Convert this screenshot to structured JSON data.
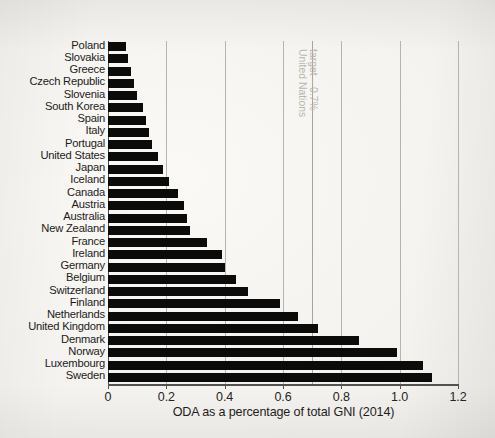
{
  "chart_data": {
    "type": "bar",
    "orientation": "horizontal",
    "title": "",
    "xlabel": "ODA as a percentage of total GNI (2014)",
    "ylabel": "",
    "xlim": [
      0,
      1.2
    ],
    "xticks": [
      "0",
      "0.2",
      "0.4",
      "0.6",
      "0.8",
      "1.0",
      "1.2"
    ],
    "xtick_values": [
      0,
      0.2,
      0.4,
      0.6,
      0.8,
      1.0,
      1.2
    ],
    "grid": "vertical",
    "legend": "none",
    "bar_color": "#0b0b0a",
    "grid_color": "#b7b4ae",
    "background_color": "#f3f1ed",
    "categories": [
      "Poland",
      "Slovakia",
      "Greece",
      "Czech Republic",
      "Slovenia",
      "South Korea",
      "Spain",
      "Italy",
      "Portugal",
      "United States",
      "Japan",
      "Iceland",
      "Canada",
      "Austria",
      "Australia",
      "New Zealand",
      "France",
      "Ireland",
      "Germany",
      "Belgium",
      "Switzerland",
      "Finland",
      "Netherlands",
      "United Kingdom",
      "Denmark",
      "Norway",
      "Luxembourg",
      "Sweden"
    ],
    "values": [
      0.06,
      0.07,
      0.08,
      0.09,
      0.1,
      0.12,
      0.13,
      0.14,
      0.15,
      0.17,
      0.19,
      0.21,
      0.24,
      0.26,
      0.27,
      0.28,
      0.34,
      0.39,
      0.4,
      0.44,
      0.48,
      0.59,
      0.65,
      0.72,
      0.86,
      0.99,
      1.08,
      1.11
    ],
    "annotations": [
      {
        "name": "un-target",
        "text_line1": "United Nations",
        "text_line2": "target – 0.7%",
        "value": 0.7,
        "orientation": "vertical",
        "color": "#b9b6b0"
      }
    ]
  }
}
